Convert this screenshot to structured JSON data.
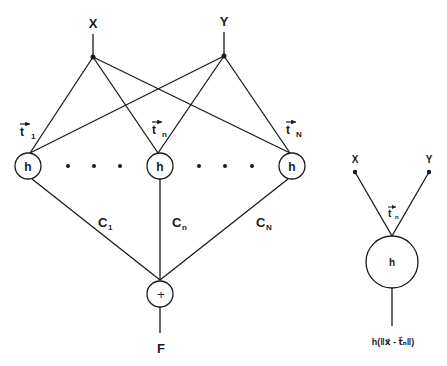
{
  "network": {
    "inputs": {
      "x": "X",
      "y": "Y"
    },
    "hidden_units": [
      {
        "label": "h",
        "weight_label": "t",
        "weight_sub": "1",
        "coef_label": "C",
        "coef_sub": "1"
      },
      {
        "label": "h",
        "weight_label": "t",
        "weight_sub": "n",
        "coef_label": "C",
        "coef_sub": "n"
      },
      {
        "label": "h",
        "weight_label": "t",
        "weight_sub": "N",
        "coef_label": "C",
        "coef_sub": "N"
      }
    ],
    "sum_symbol": "+",
    "output": "F",
    "ellipsis_dots": 6
  },
  "detail": {
    "inputs": {
      "x": "X",
      "y": "Y"
    },
    "center_label": "t",
    "center_sub": "n",
    "unit_label": "h",
    "output_formula": "h(‖x⃗ - t⃗ₙ‖)"
  },
  "colors": {
    "stroke": "#1a1a1a",
    "background": "#ffffff"
  }
}
